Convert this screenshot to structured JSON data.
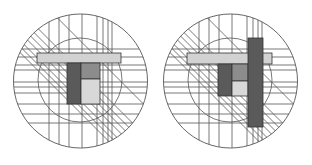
{
  "figure": {
    "title": "",
    "panels": [
      {
        "id": "left",
        "outer_circle": {
          "cx": 80.5,
          "cy": 81,
          "r": 67
        },
        "inner_circle": {
          "cx": 80,
          "cy": 80,
          "r": 42
        },
        "verticals": [
          49,
          59,
          69,
          82,
          97,
          103,
          108,
          112
        ],
        "horizontals": [
          49,
          57,
          65,
          70,
          82,
          87,
          93,
          104,
          114,
          123
        ],
        "diagonals": [
          -40,
          -10,
          -2,
          5,
          12,
          20,
          26,
          32
        ],
        "rects": [
          {
            "name": "light-bar",
            "x": 37,
            "y": 53,
            "w": 84,
            "h": 10,
            "fill": "#d2d2d2"
          },
          {
            "name": "dark-block",
            "x": 67,
            "y": 63,
            "w": 14,
            "h": 41,
            "fill": "#5a5a5a"
          },
          {
            "name": "mid-block",
            "x": 81,
            "y": 63,
            "w": 19,
            "h": 16,
            "fill": "#8c8c8c"
          },
          {
            "name": "light-block",
            "x": 81,
            "y": 79,
            "w": 19,
            "h": 25,
            "fill": "#d8d8d8"
          }
        ]
      },
      {
        "id": "right",
        "outer_circle": {
          "cx": 230.5,
          "cy": 81,
          "r": 67
        },
        "inner_circle": {
          "cx": 230,
          "cy": 80,
          "r": 42
        },
        "verticals": [
          199,
          209,
          219,
          232,
          247,
          253,
          258,
          262
        ],
        "horizontals": [
          49,
          57,
          65,
          70,
          82,
          87,
          93,
          104,
          114,
          123
        ],
        "diagonals": [
          -40,
          -10,
          -2,
          5,
          12,
          20,
          26,
          32
        ],
        "rects": [
          {
            "name": "light-bar",
            "x": 187,
            "y": 53,
            "w": 85,
            "h": 11,
            "fill": "#d2d2d2"
          },
          {
            "name": "dark-block",
            "x": 218,
            "y": 64,
            "w": 14,
            "h": 32,
            "fill": "#5a5a5a"
          },
          {
            "name": "mid-block",
            "x": 232,
            "y": 64,
            "w": 16,
            "h": 17,
            "fill": "#8c8c8c"
          },
          {
            "name": "light-block",
            "x": 232,
            "y": 81,
            "w": 16,
            "h": 15,
            "fill": "#d8d8d8"
          },
          {
            "name": "tall-dark-bar",
            "x": 248,
            "y": 38,
            "w": 15,
            "h": 89,
            "fill": "#5a5a5a"
          }
        ]
      }
    ],
    "colors": {
      "line": "#555555",
      "background": "#ffffff"
    }
  }
}
